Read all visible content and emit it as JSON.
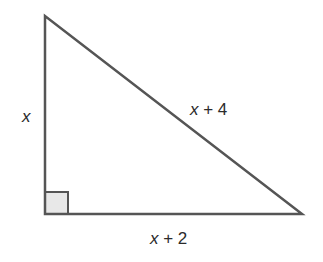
{
  "figure": {
    "type": "right-triangle",
    "vertices": {
      "top": [
        45,
        16
      ],
      "right_angle": [
        45,
        214
      ],
      "right": [
        302,
        214
      ]
    },
    "colors": {
      "stroke": "#555555",
      "right_angle_fill": "#e8e8e8",
      "text": "#2b2b2b",
      "background": "#ffffff"
    },
    "labels": {
      "left_side": "x",
      "hypotenuse_var": "x",
      "hypotenuse_rest": " + 4",
      "bottom_var": "x",
      "bottom_rest": " + 2"
    }
  }
}
